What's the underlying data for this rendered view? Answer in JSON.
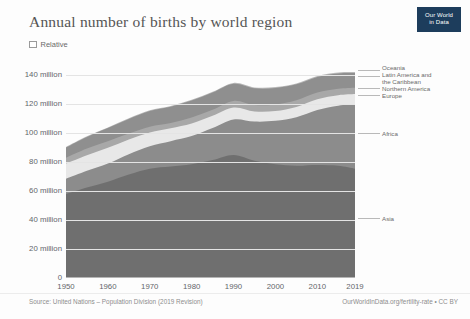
{
  "header": {
    "title": "Annual number of births by world region",
    "logo_line1": "Our World",
    "logo_line2": "in Data"
  },
  "controls": {
    "relative_label": "Relative",
    "relative_checked": false
  },
  "footer": {
    "source": "Source: United Nations – Population Division (2019 Revision)",
    "attribution": "OurWorldInData.org/fertility-rate • CC BY"
  },
  "chart_data": {
    "type": "area",
    "title": "Annual number of births by world region",
    "xlabel": "",
    "ylabel": "",
    "grid": true,
    "legend_position": "right-direct-labels",
    "xlim": [
      1950,
      2019
    ],
    "ylim": [
      0,
      145
    ],
    "yunit": "million",
    "ytick_labels": [
      "0",
      "20 million",
      "40 million",
      "60 million",
      "80 million",
      "100 million",
      "120 million",
      "140 million"
    ],
    "ytick_values": [
      0,
      20,
      40,
      60,
      80,
      100,
      120,
      140
    ],
    "xtick_labels": [
      "1950",
      "1960",
      "1970",
      "1980",
      "1990",
      "2000",
      "2010",
      "2019"
    ],
    "xtick_values": [
      1950,
      1960,
      1970,
      1980,
      1990,
      2000,
      2010,
      2019
    ],
    "x": [
      1950,
      1955,
      1960,
      1965,
      1970,
      1975,
      1980,
      1985,
      1990,
      1995,
      2000,
      2005,
      2010,
      2015,
      2019
    ],
    "series": [
      {
        "name": "Asia",
        "color": "#6f6f6f",
        "values": [
          58.0,
          62.5,
          66.5,
          71.5,
          75.5,
          77.0,
          78.5,
          81.5,
          85.0,
          81.0,
          78.5,
          77.5,
          78.0,
          77.5,
          75.5
        ]
      },
      {
        "name": "Africa",
        "color": "#8c8c8c",
        "values": [
          10.5,
          11.5,
          12.5,
          14.0,
          15.5,
          17.5,
          19.5,
          22.0,
          24.5,
          27.0,
          30.0,
          33.5,
          38.0,
          41.5,
          44.5
        ]
      },
      {
        "name": "Europe",
        "color": "#e8e8e8",
        "values": [
          10.5,
          10.8,
          10.9,
          10.2,
          9.4,
          8.9,
          8.7,
          8.5,
          8.2,
          7.0,
          6.8,
          7.1,
          7.4,
          7.2,
          7.0
        ]
      },
      {
        "name": "Northern America",
        "color": "#a8a8a8",
        "values": [
          4.1,
          4.6,
          4.6,
          4.1,
          4.1,
          3.6,
          4.1,
          4.2,
          4.6,
          4.4,
          4.5,
          4.6,
          4.6,
          4.4,
          4.3
        ]
      },
      {
        "name": "Latin America and the Caribbean",
        "color": "#8f8f8f",
        "values": [
          7.0,
          8.0,
          9.0,
          10.0,
          10.8,
          11.3,
          11.7,
          11.8,
          11.8,
          11.6,
          11.4,
          11.0,
          10.8,
          10.6,
          10.2
        ]
      },
      {
        "name": "Oceania",
        "color": "#b9b9b9",
        "values": [
          0.35,
          0.4,
          0.45,
          0.48,
          0.5,
          0.52,
          0.55,
          0.58,
          0.6,
          0.62,
          0.65,
          0.68,
          0.72,
          0.74,
          0.76
        ]
      }
    ],
    "direct_labels": [
      {
        "name": "Oceania",
        "lines": [
          "Oceania"
        ]
      },
      {
        "name": "Latin America and the Caribbean",
        "lines": [
          "Latin America and",
          "the Caribbean"
        ]
      },
      {
        "name": "Northern America",
        "lines": [
          "Northern America"
        ]
      },
      {
        "name": "Europe",
        "lines": [
          "Europe"
        ]
      },
      {
        "name": "Africa",
        "lines": [
          "Africa"
        ]
      },
      {
        "name": "Asia",
        "lines": [
          "Asia"
        ]
      }
    ]
  }
}
